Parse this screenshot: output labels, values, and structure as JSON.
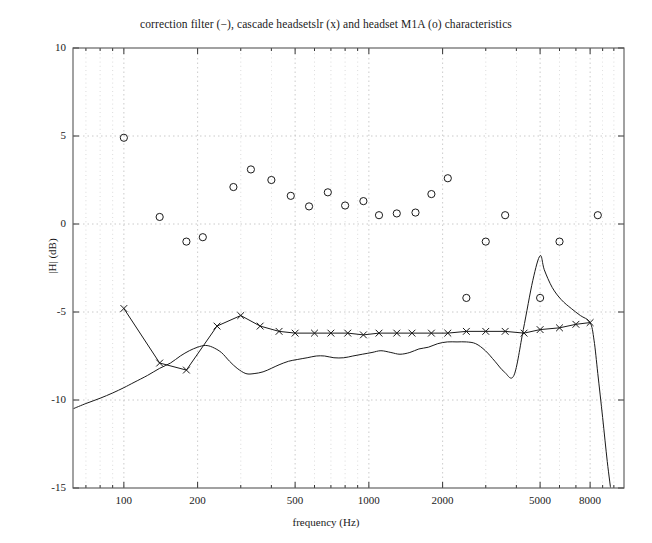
{
  "chart_data": {
    "type": "line",
    "title": "correction filter (−), cascade headsetslr (x) and headset M1A (o) characteristics",
    "xlabel": "frequency (Hz)",
    "ylabel": "|H| (dB)",
    "xscale": "log",
    "xlim": [
      62,
      11000
    ],
    "ylim": [
      -15,
      10
    ],
    "grid": true,
    "legend": "none",
    "xticks": [
      100,
      200,
      500,
      1000,
      2000,
      5000,
      8000
    ],
    "xticklabels": [
      "100",
      "200",
      "500",
      "1000",
      "2000",
      "5000",
      "8000"
    ],
    "yticks": [
      10,
      5,
      0,
      -5,
      -10,
      -15
    ],
    "yticklabels": [
      "10",
      "5",
      "0",
      "-5",
      "-10",
      "-15"
    ],
    "series": [
      {
        "name": "correction filter",
        "marker": "none",
        "linestyle": "-",
        "color": "#1a1a1a",
        "x": [
          62,
          70,
          80,
          90,
          100,
          110,
          125,
          140,
          155,
          170,
          185,
          200,
          215,
          230,
          250,
          270,
          290,
          315,
          340,
          370,
          400,
          430,
          470,
          510,
          560,
          610,
          660,
          720,
          790,
          860,
          940,
          1030,
          1120,
          1230,
          1340,
          1470,
          1600,
          1750,
          1910,
          2090,
          2290,
          2500,
          2730,
          2990,
          3270,
          3570,
          3910,
          4270,
          4670,
          5000,
          5200,
          5600,
          6100,
          6700,
          7300,
          8000,
          8300,
          8600,
          9000,
          9400,
          9800
        ],
        "y": [
          -10.5,
          -10.2,
          -9.9,
          -9.6,
          -9.3,
          -9.0,
          -8.6,
          -8.2,
          -7.9,
          -7.5,
          -7.2,
          -7.0,
          -6.9,
          -7.0,
          -7.3,
          -7.8,
          -8.2,
          -8.5,
          -8.5,
          -8.4,
          -8.2,
          -8.0,
          -7.8,
          -7.7,
          -7.6,
          -7.5,
          -7.5,
          -7.6,
          -7.6,
          -7.5,
          -7.4,
          -7.3,
          -7.2,
          -7.3,
          -7.4,
          -7.3,
          -7.1,
          -7.0,
          -6.8,
          -6.7,
          -6.7,
          -6.7,
          -6.8,
          -7.2,
          -7.8,
          -8.4,
          -8.6,
          -6.0,
          -3.2,
          -1.8,
          -2.6,
          -3.6,
          -4.3,
          -4.8,
          -5.2,
          -5.6,
          -6.6,
          -8.5,
          -11.0,
          -13.5,
          -15.5
        ]
      },
      {
        "name": "cascade headsetslr",
        "marker": "x",
        "linestyle": "-",
        "color": "#1a1a1a",
        "x": [
          100,
          140,
          180,
          240,
          300,
          360,
          430,
          500,
          600,
          700,
          820,
          950,
          1100,
          1300,
          1500,
          1800,
          2100,
          2500,
          3000,
          3600,
          4300,
          5000,
          6000,
          7000,
          8000
        ],
        "y": [
          -4.8,
          -7.9,
          -8.3,
          -5.8,
          -5.2,
          -5.8,
          -6.1,
          -6.2,
          -6.2,
          -6.2,
          -6.2,
          -6.3,
          -6.2,
          -6.2,
          -6.2,
          -6.2,
          -6.2,
          -6.1,
          -6.1,
          -6.1,
          -6.2,
          -6.0,
          -5.9,
          -5.7,
          -5.6
        ]
      },
      {
        "name": "headset M1A",
        "marker": "o",
        "linestyle": "none",
        "color": "#1a1a1a",
        "x": [
          100,
          140,
          180,
          210,
          280,
          330,
          400,
          480,
          570,
          680,
          800,
          950,
          1100,
          1300,
          1550,
          1800,
          2100,
          2500,
          3000,
          3600,
          5000,
          6000,
          8600
        ],
        "y": [
          4.9,
          0.4,
          -1.0,
          -0.75,
          2.1,
          3.1,
          2.5,
          1.6,
          1.0,
          1.8,
          1.05,
          1.3,
          0.5,
          0.6,
          0.65,
          1.7,
          2.6,
          -4.2,
          -1.0,
          0.5,
          -4.2,
          -1.0,
          0.5
        ]
      }
    ]
  },
  "axes": {
    "x_px": {
      "left": 73,
      "right": 624
    },
    "y_px": {
      "top": 48,
      "bottom": 488
    }
  }
}
